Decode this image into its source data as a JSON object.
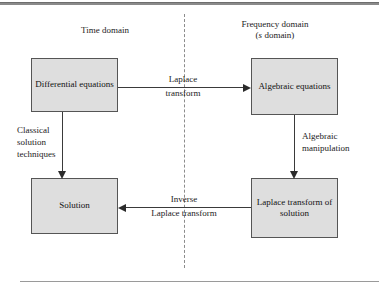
{
  "figure": {
    "headers": {
      "time_domain": "Time domain",
      "frequency_domain": "Frequency domain",
      "s_domain_prefix": "(",
      "s_domain_italic": "s",
      "s_domain_suffix": " domain)"
    },
    "nodes": {
      "differential": "Differential equations",
      "algebraic": "Algebraic equations",
      "solution": "Solution",
      "laplace_of_solution": "Laplace transform of solution"
    },
    "edges": {
      "laplace_transform_above": "Laplace",
      "laplace_transform_below": "transform",
      "inverse_above": "Inverse",
      "inverse_below": "Laplace transform",
      "classical_line1": "Classical",
      "classical_line2": "solution",
      "classical_line3": "techniques",
      "algebraic_manipulation_line1": "Algebraic",
      "algebraic_manipulation_line2": "manipulation"
    },
    "colors": {
      "node_fill": "#dedede",
      "node_border": "#555555",
      "edge": "#3a3a3a",
      "divider": "#8c8c8c",
      "text": "#111111"
    }
  }
}
